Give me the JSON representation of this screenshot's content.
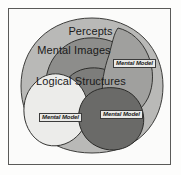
{
  "diagram": {
    "frame": {
      "name": "diagram-border"
    },
    "regions": [
      {
        "id": "percepts",
        "label": "Percepts",
        "role": "outermost-set",
        "fill": "#b9b9b7",
        "stroke": "#3c3c3a"
      },
      {
        "id": "mental-images",
        "label": "Mental Images",
        "role": "nested-set",
        "fill": "#8d8d8b",
        "stroke": "#323230"
      },
      {
        "id": "logical-structures",
        "label": "Logical Structures",
        "role": "innermost-set",
        "fill": "#7d7d7b",
        "stroke": "#2c2c2a"
      }
    ],
    "mental_models": [
      {
        "id": "mental-model-right",
        "label": "Mental Model",
        "fill": "#a0a09e",
        "stroke": "#343432"
      },
      {
        "id": "mental-model-bottom-left",
        "label": "Mental Model",
        "fill": "#ececea",
        "stroke": "#343432"
      },
      {
        "id": "mental-model-bottom-center",
        "label": "Mental Model",
        "fill": "#6a6a68",
        "stroke": "#2a2a28"
      }
    ],
    "colors": {
      "background": "#fbfbfa",
      "border": "#5a5a58",
      "label_text": "#1a1a1a",
      "callout_fill": "#e9e9e7",
      "callout_border": "#3b3b3b"
    }
  }
}
